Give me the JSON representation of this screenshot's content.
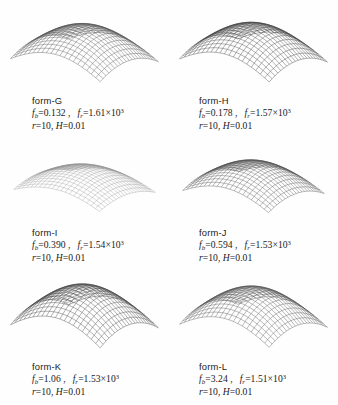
{
  "figure": {
    "type": "surface-plot-array",
    "rows": 3,
    "columns": 2,
    "background_color": "#fefefe",
    "mesh_color": "#4a4a4a"
  },
  "panels": [
    {
      "id": "form-G",
      "name": "form-G",
      "fb_label": "f",
      "fb_sub": "b",
      "fb_value": "=0.132",
      "comma": " ,",
      "fr_label": "f",
      "fr_sub": "r",
      "fr_value": "=1.61×10",
      "fr_exp": "3",
      "r_label": "r",
      "r_value": "=10,",
      "h_label": "H",
      "h_value": "=0.01",
      "line2": "fᵢ=0.132 ,   fᵣ=1.61×10³",
      "line3": "r=10, H=0.01",
      "shade": "normal"
    },
    {
      "id": "form-H",
      "name": "form-H",
      "fb_label": "f",
      "fb_sub": "b",
      "fb_value": "=0.178",
      "comma": " ,",
      "fr_label": "f",
      "fr_sub": "r",
      "fr_value": "=1.57×10",
      "fr_exp": "3",
      "r_label": "r",
      "r_value": "=10,",
      "h_label": "H",
      "h_value": "=0.01",
      "line2": "fᵢ=0.178 ,   fᵣ=1.57×10³",
      "line3": "r=10, H=0.01",
      "shade": "dark"
    },
    {
      "id": "form-I",
      "name": "form-I",
      "fb_label": "f",
      "fb_sub": "b",
      "fb_value": "=0.390",
      "comma": " ,",
      "fr_label": "f",
      "fr_sub": "r",
      "fr_value": "=1.54×10",
      "fr_exp": "3",
      "r_label": "r",
      "r_value": "=10,",
      "h_label": "H",
      "h_value": "=0.01",
      "line2": "fᵢ=0.390 ,   fᵣ=1.54×10³",
      "line3": "r=10, H=0.01",
      "shade": "light"
    },
    {
      "id": "form-J",
      "name": "form-J",
      "fb_label": "f",
      "fb_sub": "b",
      "fb_value": "=0.594",
      "comma": " ,",
      "fr_label": "f",
      "fr_sub": "r",
      "fr_value": "=1.53×10",
      "fr_exp": "3",
      "r_label": "r",
      "r_value": "=10,",
      "h_label": "H",
      "h_value": "=0.01",
      "line2": "fᵢ=0.594 ,   fᵣ=1.53×10³",
      "line3": "r=10, H=0.01",
      "shade": "normal"
    },
    {
      "id": "form-K",
      "name": "form-K",
      "fb_label": "f",
      "fb_sub": "b",
      "fb_value": "=1.06",
      "comma": " ,",
      "fr_label": "f",
      "fr_sub": "r",
      "fr_value": "=1.53×10",
      "fr_exp": "3",
      "r_label": "r",
      "r_value": "=10,",
      "h_label": "H",
      "h_value": "=0.01",
      "line2": "fᵢ=1.06 ,   fᵣ=1.53×10³",
      "line3": "r=10, H=0.01",
      "shade": "dark"
    },
    {
      "id": "form-L",
      "name": "form-L",
      "fb_label": "f",
      "fb_sub": "b",
      "fb_value": "=3.24",
      "comma": " ,",
      "fr_label": "f",
      "fr_sub": "r",
      "fr_value": "=1.51×10",
      "fr_exp": "3",
      "r_label": "r",
      "r_value": "=10,",
      "h_label": "H",
      "h_value": "=0.01",
      "line2": "fᵢ=3.24 ,   fᵣ=1.51×10³",
      "line3": "r=10, H=0.01",
      "shade": "normal"
    }
  ],
  "chart_data": {
    "type": "surface",
    "title": "",
    "xlabel": "",
    "ylabel": "",
    "series": [
      {
        "name": "form-G",
        "fb": 0.132,
        "fr": 1610,
        "r": 10,
        "H": 0.01,
        "amplitude": 1.0
      },
      {
        "name": "form-H",
        "fb": 0.178,
        "fr": 1570,
        "r": 10,
        "H": 0.01,
        "amplitude": 1.05
      },
      {
        "name": "form-I",
        "fb": 0.39,
        "fr": 1540,
        "r": 10,
        "H": 0.01,
        "amplitude": 0.72
      },
      {
        "name": "form-J",
        "fb": 0.594,
        "fr": 1530,
        "r": 10,
        "H": 0.01,
        "amplitude": 0.9
      },
      {
        "name": "form-K",
        "fb": 1.06,
        "fr": 1530,
        "r": 10,
        "H": 0.01,
        "amplitude": 1.18
      },
      {
        "name": "form-L",
        "fb": 3.24,
        "fr": 1510,
        "r": 10,
        "H": 0.01,
        "amplitude": 1.1
      }
    ]
  }
}
